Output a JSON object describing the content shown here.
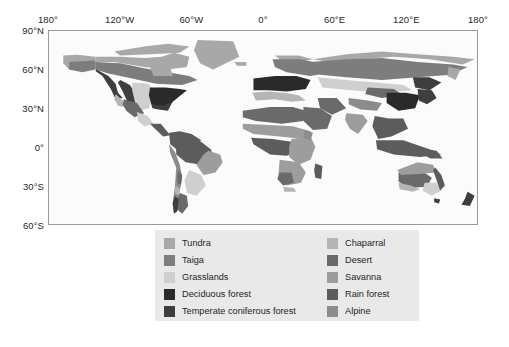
{
  "chart_data": {
    "type": "map",
    "projection": "equirectangular",
    "xlabel": "Longitude",
    "ylabel": "Latitude",
    "xlim": [
      -180,
      180
    ],
    "ylim": [
      -60,
      90
    ],
    "grid": false,
    "x_ticks": [
      {
        "value": -180,
        "label": "180°"
      },
      {
        "value": -120,
        "label": "120°W"
      },
      {
        "value": -60,
        "label": "60°W"
      },
      {
        "value": 0,
        "label": "0°"
      },
      {
        "value": 60,
        "label": "60°E"
      },
      {
        "value": 120,
        "label": "120°E"
      },
      {
        "value": 180,
        "label": "180°"
      }
    ],
    "y_ticks": [
      {
        "value": 90,
        "label": "90°N"
      },
      {
        "value": 60,
        "label": "60°N"
      },
      {
        "value": 30,
        "label": "30°N"
      },
      {
        "value": 0,
        "label": "0°"
      },
      {
        "value": -30,
        "label": "30°S"
      },
      {
        "value": -60,
        "label": "60°S"
      }
    ],
    "legend_position": "bottom-center",
    "categories": [
      {
        "label": "Tundra",
        "color": "#a8a8a8"
      },
      {
        "label": "Taiga",
        "color": "#7d7d7d"
      },
      {
        "label": "Grasslands",
        "color": "#cfcfcf"
      },
      {
        "label": "Deciduous forest",
        "color": "#2a2a2a"
      },
      {
        "label": "Temperate coniferous forest",
        "color": "#3e3e3e"
      },
      {
        "label": "Chaparral",
        "color": "#b5b5b5"
      },
      {
        "label": "Desert",
        "color": "#6a6a6a"
      },
      {
        "label": "Savanna",
        "color": "#9d9d9d"
      },
      {
        "label": "Rain forest",
        "color": "#5c5c5c"
      },
      {
        "label": "Alpine",
        "color": "#8c8c8c"
      }
    ],
    "ocean_color": "#fbfbfb",
    "frame_color": "#9a9a9a"
  },
  "axes": {
    "x_ticks": [
      {
        "label": "180°",
        "pct": 0
      },
      {
        "label": "120°W",
        "pct": 16.667
      },
      {
        "label": "60°W",
        "pct": 33.333
      },
      {
        "label": "0°",
        "pct": 50
      },
      {
        "label": "60°E",
        "pct": 66.667
      },
      {
        "label": "120°E",
        "pct": 83.333
      },
      {
        "label": "180°",
        "pct": 100
      }
    ],
    "y_ticks": [
      {
        "label": "90°N",
        "pct": 0
      },
      {
        "label": "60°N",
        "pct": 20
      },
      {
        "label": "30°N",
        "pct": 40
      },
      {
        "label": "0°",
        "pct": 60
      },
      {
        "label": "30°S",
        "pct": 80
      },
      {
        "label": "60°S",
        "pct": 100
      }
    ]
  },
  "legend": {
    "left_column": [
      {
        "label": "Tundra",
        "color": "#a8a8a8"
      },
      {
        "label": "Taiga",
        "color": "#7d7d7d"
      },
      {
        "label": "Grasslands",
        "color": "#cfcfcf"
      },
      {
        "label": "Deciduous forest",
        "color": "#2a2a2a"
      },
      {
        "label": "Temperate coniferous forest",
        "color": "#3e3e3e"
      }
    ],
    "right_column": [
      {
        "label": "Chaparral",
        "color": "#b5b5b5"
      },
      {
        "label": "Desert",
        "color": "#6a6a6a"
      },
      {
        "label": "Savanna",
        "color": "#9d9d9d"
      },
      {
        "label": "Rain forest",
        "color": "#5c5c5c"
      },
      {
        "label": "Alpine",
        "color": "#8c8c8c"
      }
    ]
  }
}
